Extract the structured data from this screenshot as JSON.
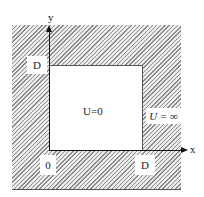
{
  "diagram": {
    "type": "infinite square potential well",
    "axes": {
      "x_label": "x",
      "y_label": "y"
    },
    "labels": {
      "y_tick": "D",
      "origin": "0",
      "x_tick": "D",
      "inside": "U=0",
      "outside": "U = ∞"
    },
    "colors": {
      "hatch": "#8a8a8a",
      "background": "#ffffff",
      "axis": "#111111"
    }
  }
}
